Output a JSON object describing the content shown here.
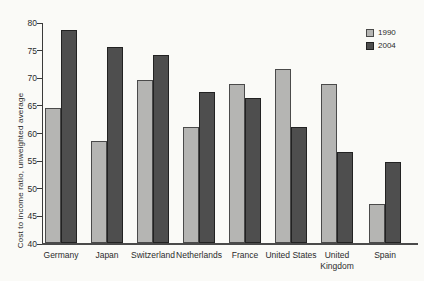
{
  "chart_data": {
    "type": "bar",
    "categories": [
      "Germany",
      "Japan",
      "Switzerland",
      "Netherlands",
      "France",
      "United States",
      "United Kingdom",
      "Spain"
    ],
    "series": [
      {
        "name": "1990",
        "color": "#b5b5b3",
        "values": [
          64.5,
          58.5,
          69.5,
          61.0,
          68.7,
          71.5,
          68.7,
          47.0
        ]
      },
      {
        "name": "2004",
        "color": "#4e4e4e",
        "values": [
          78.5,
          75.5,
          74.0,
          67.3,
          66.2,
          61.0,
          56.5,
          54.7
        ]
      }
    ],
    "title": "",
    "xlabel": "",
    "ylabel": "Cost to income ratio, unweighted average",
    "ylim": [
      40,
      80
    ],
    "yticks": [
      40,
      45,
      50,
      55,
      60,
      65,
      70,
      75,
      80
    ],
    "grid": false,
    "legend_position": "top-right"
  },
  "colors": {
    "background": "#fafaf7",
    "axis": "#3a3a3a",
    "text": "#2b2b2b",
    "series_1990": "#b5b5b3",
    "series_2004": "#4e4e4e"
  }
}
